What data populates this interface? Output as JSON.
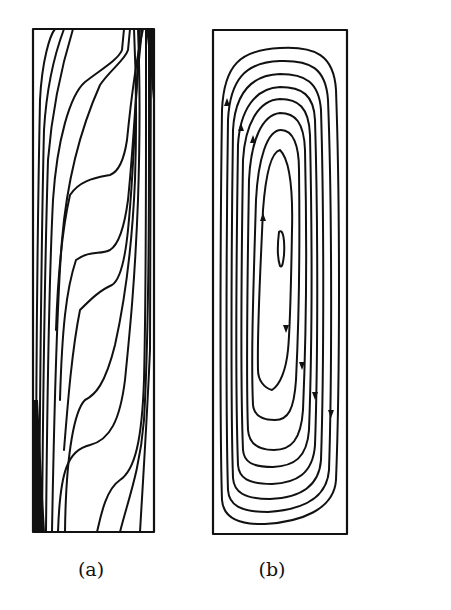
{
  "figure": {
    "panels": [
      {
        "id": "a",
        "label": "(a)",
        "content": "isotherm-contours",
        "frame_color": "#111111"
      },
      {
        "id": "b",
        "label": "(b)",
        "content": "streamline-contours",
        "frame_color": "#111111",
        "flow_direction": "clockwise"
      }
    ],
    "colors": {
      "line": "#111111",
      "background": "#ffffff"
    }
  }
}
